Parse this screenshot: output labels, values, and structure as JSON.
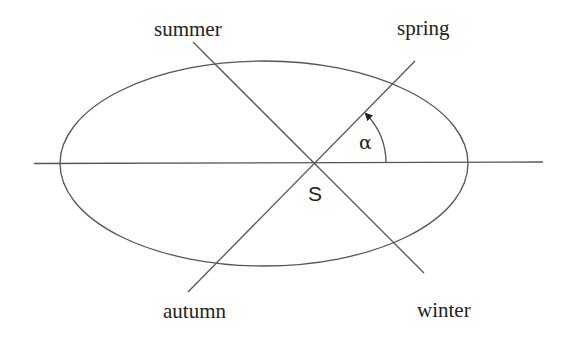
{
  "diagram": {
    "labels": {
      "summer": "summer",
      "spring": "spring",
      "autumn": "autumn",
      "winter": "winter",
      "sun": "S",
      "angle": "α"
    },
    "colors": {
      "line": "#555555",
      "text": "#222222",
      "background": "#ffffff"
    }
  }
}
